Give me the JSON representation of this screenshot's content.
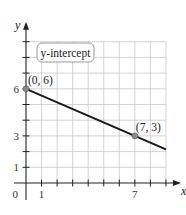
{
  "chart_data": {
    "type": "line",
    "title": "",
    "xlabel": "x",
    "ylabel": "y",
    "xlim": [
      0,
      9
    ],
    "ylim": [
      0,
      9
    ],
    "grid": true,
    "x_ticks": [
      1,
      2,
      3,
      4,
      5,
      6,
      7,
      8,
      9
    ],
    "y_ticks": [
      1,
      2,
      3,
      4,
      5,
      6,
      7,
      8,
      9
    ],
    "x_tick_labels": {
      "1": "1",
      "7": "7"
    },
    "y_tick_labels": {
      "1": "1",
      "3": "3",
      "6": "6"
    },
    "origin_label": "0",
    "series": [
      {
        "name": "line",
        "points": [
          [
            0,
            6
          ],
          [
            7,
            3
          ]
        ],
        "slope": -0.428571,
        "intercept": 6,
        "x_range": [
          0,
          9
        ]
      }
    ],
    "points": [
      {
        "x": 0,
        "y": 6,
        "label": "(0, 6)"
      },
      {
        "x": 7,
        "y": 3,
        "label": "(7, 3)"
      }
    ],
    "annotations": [
      {
        "text": "y-intercept",
        "type": "callout",
        "points_to": [
          0,
          6
        ]
      }
    ],
    "colors": {
      "grid": "#c8c8c8",
      "axis": "#222222",
      "line": "#1a1a1a",
      "point": "#8a8a8a",
      "callout_border": "#9a9a9a"
    }
  }
}
